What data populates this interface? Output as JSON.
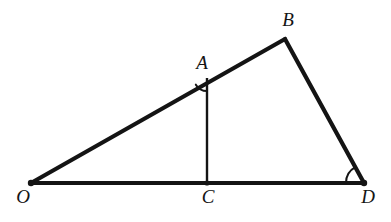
{
  "figure": {
    "background_color": "#ffffff",
    "stroke_color": "#141414",
    "label_color": "#141414",
    "width": 391,
    "height": 222
  },
  "points": {
    "O": {
      "label": "O",
      "x": 31,
      "y": 183,
      "label_x": 23,
      "label_y": 199
    },
    "A": {
      "label": "A",
      "x": 207,
      "y": 78,
      "label_x": 202,
      "label_y": 65
    },
    "B": {
      "label": "B",
      "x": 285,
      "y": 39,
      "label_x": 288,
      "label_y": 22
    },
    "C": {
      "label": "C",
      "x": 207,
      "y": 183,
      "label_x": 208,
      "label_y": 199
    },
    "D": {
      "label": "D",
      "x": 364,
      "y": 183,
      "label_x": 368,
      "label_y": 199
    }
  },
  "segments": [
    {
      "name": "segment-OB",
      "from": "O",
      "to": "B",
      "width": 4.2
    },
    {
      "name": "segment-BD",
      "from": "B",
      "to": "D",
      "width": 4.2
    },
    {
      "name": "segment-OD",
      "from": "O",
      "to": "D",
      "width": 4.2
    },
    {
      "name": "segment-AC",
      "from": "A",
      "to": "C",
      "width": 2.4
    }
  ],
  "angle_marks": [
    {
      "name": "angle-arc-at-A",
      "vertex": "A",
      "radius": 13,
      "width": 2.0
    },
    {
      "name": "angle-arc-at-D",
      "vertex": "D",
      "radius": 18,
      "width": 2.0
    }
  ],
  "vertex_dots": [
    {
      "name": "vertex-dot-O",
      "at": "O",
      "r": 3.2
    },
    {
      "name": "vertex-dot-C",
      "at": "C",
      "r": 2.6
    },
    {
      "name": "vertex-dot-D",
      "at": "D",
      "r": 3.2
    }
  ]
}
